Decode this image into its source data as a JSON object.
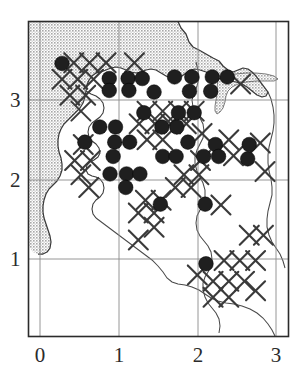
{
  "figure": {
    "kind": "distribution-map",
    "background_color": "#ffffff",
    "frame_color": "#2b2b2b",
    "grid_color": "#8a8a8a",
    "sea_fill_color": "#c9c9c9",
    "land_fill_color": "#ffffff",
    "coast_line_color": "#3a3a3a",
    "marker_dot_color": "#1f1f1f",
    "marker_cross_color": "#3a3a3a"
  },
  "axes": {
    "x_tick_labels": [
      "0",
      "1",
      "2",
      "3"
    ],
    "y_tick_labels": [
      "1",
      "2",
      "3"
    ],
    "x_tick_values": [
      0,
      1,
      2,
      3
    ],
    "y_tick_values": [
      1,
      2,
      3
    ],
    "xlim": [
      -0.15,
      3.17
    ],
    "ylim": [
      0.23,
      3.73
    ]
  },
  "chart_data": {
    "type": "scatter",
    "title": "",
    "subtitle": "",
    "xlabel": "",
    "ylabel": "",
    "xlim": [
      -0.15,
      3.17
    ],
    "ylim": [
      0.23,
      3.73
    ],
    "grid": true,
    "legend": null,
    "legend_position": "none",
    "series": [
      {
        "name": "filled-circle-record",
        "marker": "filled-circle",
        "color": "#1f1f1f",
        "count": 52,
        "points": [
          [
            0.28,
            3.46
          ],
          [
            0.88,
            3.27
          ],
          [
            1.12,
            3.27
          ],
          [
            1.3,
            3.27
          ],
          [
            1.71,
            3.29
          ],
          [
            1.93,
            3.29
          ],
          [
            2.19,
            3.29
          ],
          [
            2.38,
            3.29
          ],
          [
            0.88,
            3.12
          ],
          [
            1.13,
            3.12
          ],
          [
            1.45,
            3.1
          ],
          [
            1.9,
            3.11
          ],
          [
            2.17,
            3.11
          ],
          [
            1.32,
            2.84
          ],
          [
            1.76,
            2.84
          ],
          [
            1.96,
            2.84
          ],
          [
            0.76,
            2.66
          ],
          [
            0.96,
            2.66
          ],
          [
            1.55,
            2.66
          ],
          [
            1.74,
            2.66
          ],
          [
            0.57,
            2.47
          ],
          [
            0.95,
            2.47
          ],
          [
            1.14,
            2.47
          ],
          [
            1.88,
            2.47
          ],
          [
            2.23,
            2.44
          ],
          [
            2.66,
            2.44
          ],
          [
            0.93,
            2.29
          ],
          [
            1.56,
            2.29
          ],
          [
            1.73,
            2.29
          ],
          [
            2.08,
            2.29
          ],
          [
            2.27,
            2.29
          ],
          [
            2.64,
            2.26
          ],
          [
            0.89,
            2.07
          ],
          [
            1.1,
            2.07
          ],
          [
            1.27,
            2.07
          ],
          [
            1.09,
            1.9
          ],
          [
            1.53,
            1.69
          ],
          [
            2.1,
            1.69
          ],
          [
            2.11,
            0.94
          ]
        ]
      },
      {
        "name": "cross-marker",
        "marker": "x-cross",
        "color": "#3a3a3a",
        "count": 46,
        "points": [
          [
            0.43,
            3.47
          ],
          [
            0.63,
            3.47
          ],
          [
            0.84,
            3.47
          ],
          [
            1.2,
            3.47
          ],
          [
            2.55,
            3.2
          ],
          [
            0.28,
            3.26
          ],
          [
            0.48,
            3.26
          ],
          [
            0.68,
            3.26
          ],
          [
            0.38,
            3.06
          ],
          [
            0.58,
            3.06
          ],
          [
            0.52,
            2.86
          ],
          [
            1.36,
            2.86
          ],
          [
            1.56,
            2.86
          ],
          [
            1.76,
            2.86
          ],
          [
            1.96,
            2.86
          ],
          [
            1.26,
            2.7
          ],
          [
            1.46,
            2.7
          ],
          [
            1.66,
            2.7
          ],
          [
            1.86,
            2.7
          ],
          [
            2.06,
            2.58
          ],
          [
            2.4,
            2.5
          ],
          [
            2.8,
            2.46
          ],
          [
            0.55,
            2.44
          ],
          [
            1.36,
            2.5
          ],
          [
            1.56,
            2.5
          ],
          [
            0.44,
            2.24
          ],
          [
            0.64,
            2.24
          ],
          [
            2.04,
            2.24
          ],
          [
            2.46,
            2.3
          ],
          [
            0.52,
            2.06
          ],
          [
            1.83,
            2.06
          ],
          [
            2.02,
            2.06
          ],
          [
            2.86,
            2.1
          ],
          [
            0.62,
            1.9
          ],
          [
            1.72,
            1.9
          ],
          [
            1.92,
            1.9
          ],
          [
            1.34,
            1.74
          ],
          [
            1.54,
            1.74
          ],
          [
            2.3,
            1.68
          ],
          [
            1.25,
            1.58
          ],
          [
            1.45,
            1.58
          ],
          [
            1.45,
            1.4
          ],
          [
            1.25,
            1.24
          ],
          [
            2.66,
            1.3
          ],
          [
            2.84,
            1.3
          ],
          [
            2.34,
            0.98
          ],
          [
            2.54,
            0.98
          ],
          [
            2.74,
            0.98
          ],
          [
            2.0,
            0.8
          ],
          [
            2.2,
            0.72
          ],
          [
            2.4,
            0.72
          ],
          [
            2.6,
            0.72
          ],
          [
            2.2,
            0.52
          ],
          [
            2.4,
            0.52
          ],
          [
            2.74,
            0.6
          ]
        ]
      }
    ]
  },
  "regions": {
    "sea": {
      "name": "sea-shading",
      "fill": "#c9c9c9",
      "hatch": "stipple"
    },
    "inlet": {
      "name": "estuary-inlet",
      "fill": "#c9c9c9"
    }
  }
}
